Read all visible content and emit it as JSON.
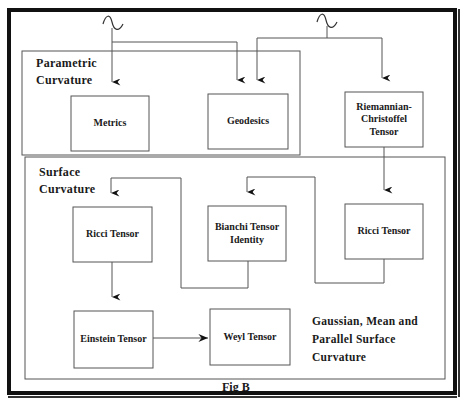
{
  "figure": {
    "caption": "Fig B",
    "colors": {
      "line": "#555555",
      "frame": "#111111",
      "text": "#1a1a1a",
      "background": "#ffffff"
    }
  },
  "regions": {
    "parametric": {
      "line1": "Parametric",
      "line2": "Curvature"
    },
    "surface": {
      "line1": "Surface",
      "line2": "Curvature"
    }
  },
  "nodes": {
    "metrics": {
      "label": "Metrics"
    },
    "geodesics": {
      "label": "Geodesics"
    },
    "riemannian": {
      "line1": "Riemannian-",
      "line2": "Christoffel",
      "line3": "Tensor"
    },
    "ricci_left": {
      "label": "Ricci Tensor"
    },
    "bianchi": {
      "line1": "Bianchi Tensor",
      "line2": "Identity"
    },
    "ricci_right": {
      "label": "Ricci Tensor"
    },
    "einstein": {
      "label": "Einstein Tensor"
    },
    "weyl": {
      "label": "Weyl Tensor"
    }
  },
  "note": {
    "line1": "Gaussian, Mean and",
    "line2": "Parallel Surface",
    "line3": "Curvature"
  },
  "sources": [
    {
      "id": "source-wave-left",
      "symbol": "sine-wave"
    },
    {
      "id": "source-wave-right",
      "symbol": "sine-wave"
    }
  ],
  "edges": [
    {
      "from": "source-wave-left",
      "to": "metrics"
    },
    {
      "from": "source-wave-left",
      "to": "geodesics"
    },
    {
      "from": "source-wave-right",
      "to": "geodesics"
    },
    {
      "from": "source-wave-right",
      "to": "riemannian"
    },
    {
      "from": "riemannian",
      "to": "ricci_right"
    },
    {
      "from": "ricci_right",
      "to": "bianchi"
    },
    {
      "from": "bianchi",
      "to": "ricci_left"
    },
    {
      "from": "ricci_left",
      "to": "einstein"
    },
    {
      "from": "einstein",
      "to": "weyl"
    }
  ]
}
